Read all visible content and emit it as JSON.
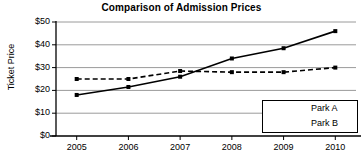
{
  "chart_data": {
    "type": "line",
    "title": "Comparison of Admission Prices",
    "xlabel": "",
    "ylabel": "Ticket Price",
    "categories": [
      "2005",
      "2006",
      "2007",
      "2008",
      "2009",
      "2010"
    ],
    "x": [
      2005,
      2006,
      2007,
      2008,
      2009,
      2010
    ],
    "xlim": [
      2004.6,
      2010.4
    ],
    "ylim": [
      0,
      50
    ],
    "y_ticks": [
      0,
      10,
      20,
      30,
      40,
      50
    ],
    "y_tick_labels": [
      "$0",
      "$10",
      "$20",
      "$30",
      "$40",
      "$50"
    ],
    "x_tick_labels": [
      "2005",
      "2006",
      "2007",
      "2008",
      "2009",
      "2010"
    ],
    "grid": "horizontal",
    "legend_position": "bottom-right",
    "series": [
      {
        "name": "Park A",
        "values": [
          18,
          21.5,
          26,
          34,
          38.5,
          46
        ],
        "line_style": "solid",
        "marker": "square",
        "color": "#000000"
      },
      {
        "name": "Park B",
        "values": [
          25,
          25,
          28.5,
          28,
          28,
          30
        ],
        "line_style": "dashed",
        "marker": "square",
        "color": "#000000"
      }
    ]
  },
  "legend": {
    "items": [
      {
        "label": "Park A"
      },
      {
        "label": "Park B"
      }
    ]
  },
  "colors": {
    "axis": "#000000",
    "grid": "#9a9a9a",
    "background": "#ffffff",
    "series": "#000000"
  }
}
